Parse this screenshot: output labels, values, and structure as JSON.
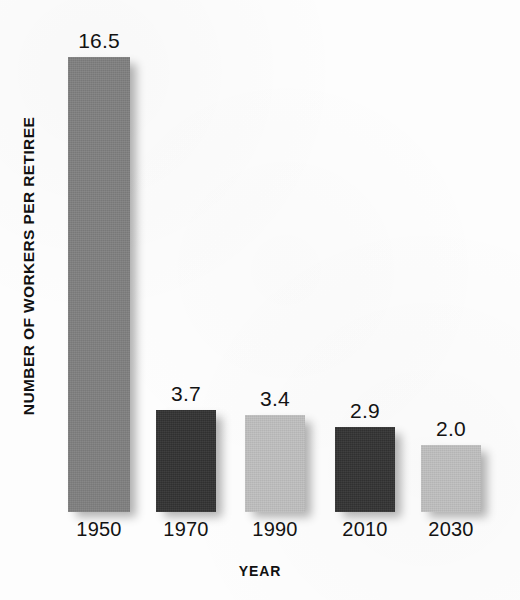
{
  "chart_data": {
    "type": "bar",
    "title": "",
    "xlabel": "YEAR",
    "ylabel": "NUMBER OF WORKERS PER RETIREE",
    "categories": [
      "1950",
      "1970",
      "1990",
      "2010",
      "2030"
    ],
    "values": [
      16.5,
      3.7,
      3.4,
      2.9,
      2.0
    ],
    "value_labels": [
      "16.5",
      "3.7",
      "3.4",
      "2.9",
      "2.0"
    ],
    "ylim": [
      0,
      16.5
    ],
    "grid": false,
    "legend": false,
    "bar_colors": [
      "#808080",
      "#333333",
      "#c0c0c0",
      "#333333",
      "#c0c0c0"
    ],
    "series": [
      {
        "name": "Number of workers per retiree",
        "values": [
          16.5,
          3.7,
          3.4,
          2.9,
          2.0
        ]
      }
    ],
    "bars": [
      {
        "category": "1950",
        "value": 16.5,
        "label": "16.5",
        "color": "#808080",
        "left": 68,
        "width": 62,
        "height": 455
      },
      {
        "category": "1970",
        "value": 3.7,
        "label": "3.7",
        "color": "#333333",
        "left": 156,
        "width": 60,
        "height": 102
      },
      {
        "category": "1990",
        "value": 3.4,
        "label": "3.4",
        "color": "#c0c0c0",
        "left": 245,
        "width": 60,
        "height": 97
      },
      {
        "category": "2010",
        "value": 2.9,
        "label": "2.9",
        "color": "#333333",
        "left": 335,
        "width": 60,
        "height": 85
      },
      {
        "category": "2030",
        "value": 2.0,
        "label": "2.0",
        "color": "#c0c0c0",
        "left": 421,
        "width": 60,
        "height": 67
      }
    ]
  },
  "layout": {
    "baseline_y": 512,
    "tick_label_y": 518,
    "x_title_y": 563
  }
}
